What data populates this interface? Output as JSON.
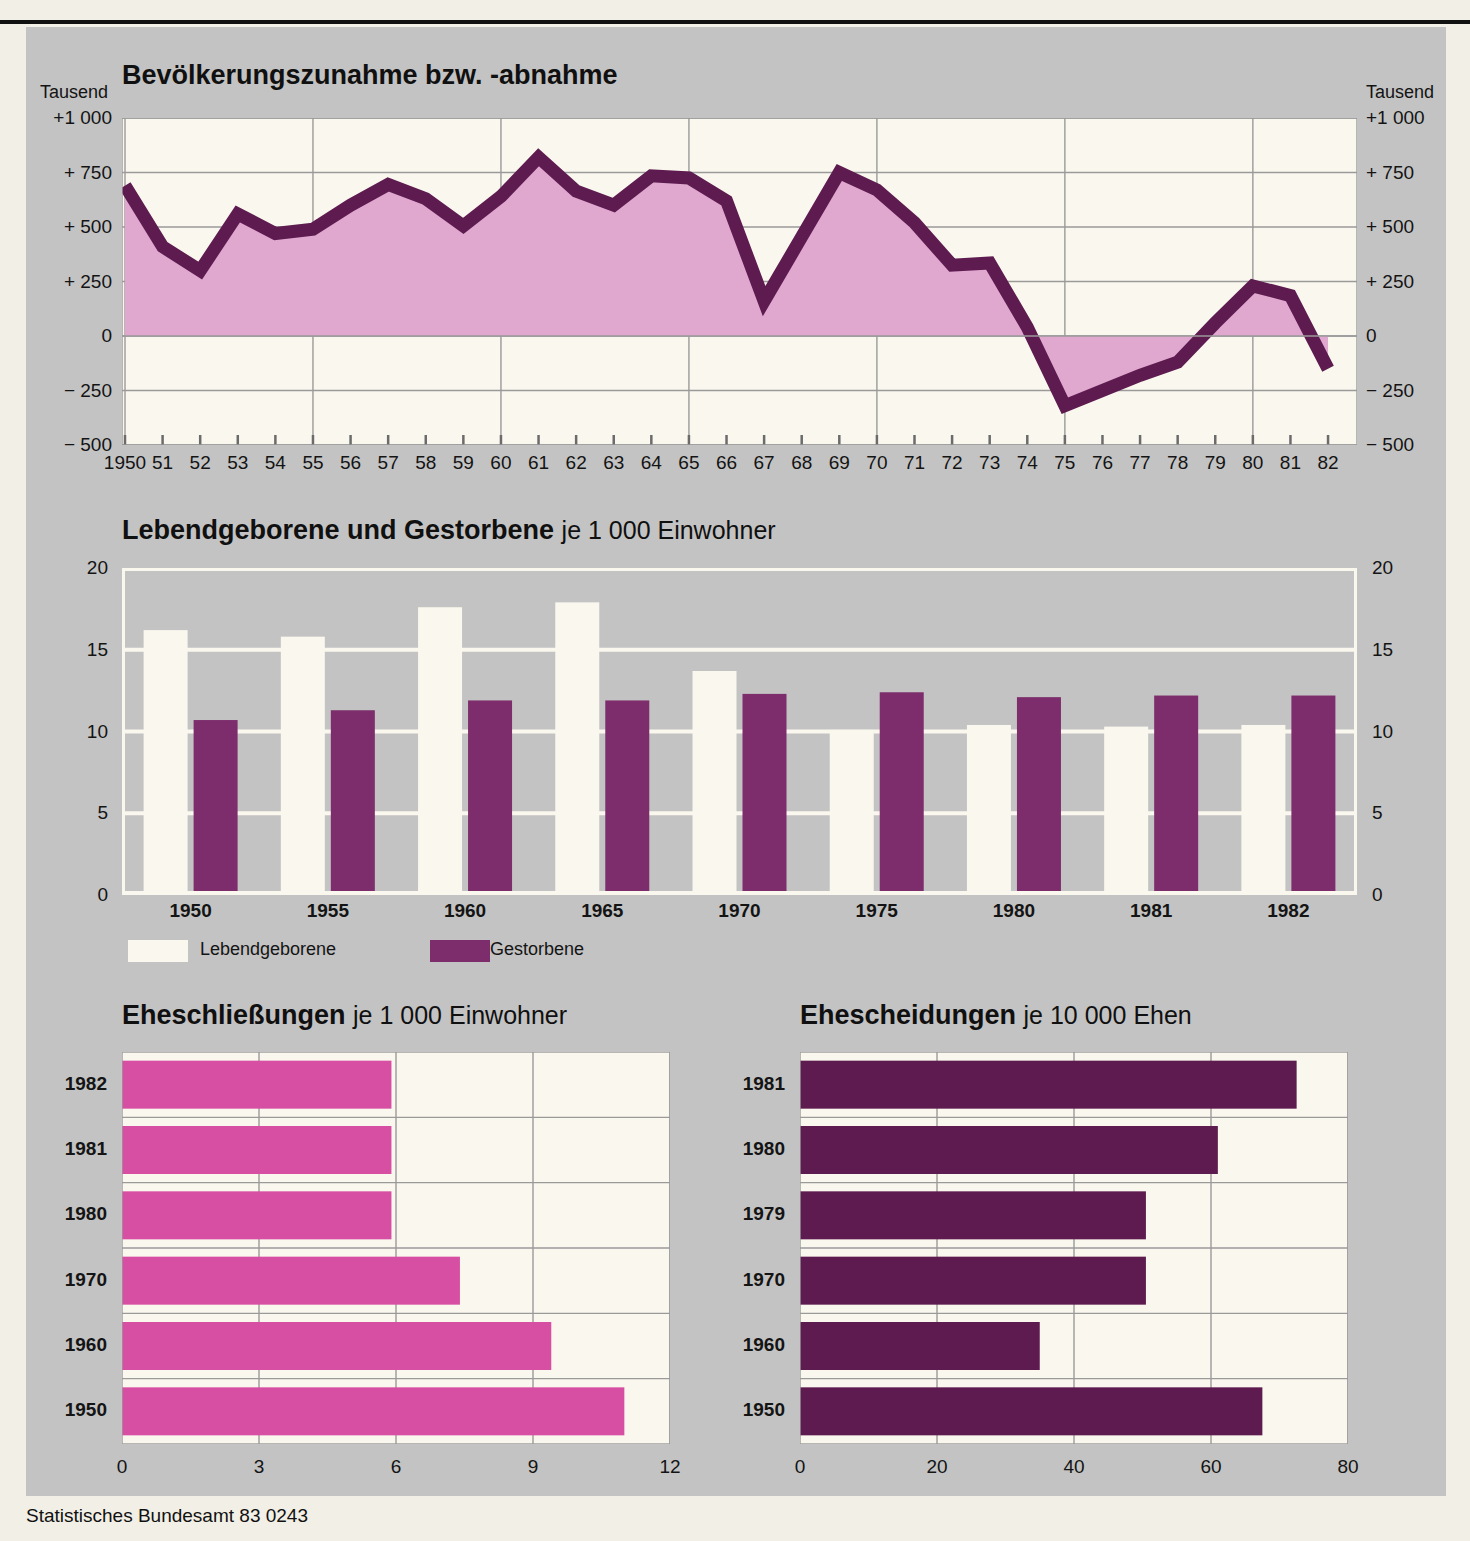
{
  "source_note": "Statistisches Bundesamt 83 0243",
  "chart_data": [
    {
      "type": "area",
      "id": "bevoelkerung",
      "title": "Bevölkerungszunahme bzw. -abnahme",
      "subtitle": "",
      "unit_label": "Tausend",
      "xlabel": "",
      "ylabel": "Tausend",
      "ylim": [
        -500,
        1000
      ],
      "yticks": [
        1000,
        750,
        500,
        250,
        0,
        -250,
        -500
      ],
      "ytick_labels": [
        "+1 000",
        "+  750",
        "+  500",
        "+  250",
        "0",
        "−  250",
        "−  500"
      ],
      "grid": true,
      "x": [
        1950,
        1951,
        1952,
        1953,
        1954,
        1955,
        1956,
        1957,
        1958,
        1959,
        1960,
        1961,
        1962,
        1963,
        1964,
        1965,
        1966,
        1967,
        1968,
        1969,
        1970,
        1971,
        1972,
        1973,
        1974,
        1975,
        1976,
        1977,
        1978,
        1979,
        1980,
        1981,
        1982
      ],
      "categories": [
        "1950",
        "51",
        "52",
        "53",
        "54",
        "55",
        "56",
        "57",
        "58",
        "59",
        "60",
        "61",
        "62",
        "63",
        "64",
        "65",
        "66",
        "67",
        "68",
        "69",
        "70",
        "71",
        "72",
        "73",
        "74",
        "75",
        "76",
        "77",
        "78",
        "79",
        "80",
        "81",
        "82"
      ],
      "values": [
        690,
        410,
        300,
        560,
        470,
        490,
        600,
        695,
        630,
        505,
        640,
        820,
        665,
        600,
        735,
        725,
        620,
        160,
        455,
        750,
        670,
        520,
        325,
        335,
        40,
        -320,
        -250,
        -180,
        -120,
        60,
        230,
        185,
        -150
      ]
    },
    {
      "type": "bar",
      "id": "geburten-sterbefaelle",
      "title": "Lebendgeborene und Gestorbene",
      "subtitle": "je 1 000 Einwohner",
      "xlabel": "",
      "ylabel": "",
      "ylim": [
        0,
        20
      ],
      "yticks": [
        0,
        5,
        10,
        15,
        20
      ],
      "grid": true,
      "legend_position": "bottom-left",
      "categories": [
        "1950",
        "1955",
        "1960",
        "1965",
        "1970",
        "1975",
        "1980",
        "1981",
        "1982"
      ],
      "series": [
        {
          "name": "Lebendgeborene",
          "color": "#faf7ee",
          "values": [
            16.2,
            15.8,
            17.6,
            17.9,
            13.7,
            10.1,
            10.4,
            10.3,
            10.4
          ]
        },
        {
          "name": "Gestorbene",
          "color": "#7d2d6b",
          "values": [
            10.7,
            11.3,
            11.9,
            11.9,
            12.3,
            12.4,
            12.1,
            12.2,
            12.2
          ]
        }
      ]
    },
    {
      "type": "bar",
      "id": "eheschliessungen",
      "orientation": "horizontal",
      "title": "Eheschließungen",
      "subtitle": "je 1 000 Einwohner",
      "xlabel": "",
      "ylabel": "",
      "xlim": [
        0,
        12
      ],
      "xticks": [
        0,
        3,
        6,
        9,
        12
      ],
      "grid": true,
      "bar_color": "#d64fa3",
      "categories": [
        "1982",
        "1981",
        "1980",
        "1970",
        "1960",
        "1950"
      ],
      "values": [
        5.9,
        5.9,
        5.9,
        7.4,
        9.4,
        11.0
      ]
    },
    {
      "type": "bar",
      "id": "ehescheidungen",
      "orientation": "horizontal",
      "title": "Ehescheidungen",
      "subtitle": "je 10 000 Ehen",
      "xlabel": "",
      "ylabel": "",
      "xlim": [
        0,
        80
      ],
      "xticks": [
        0,
        20,
        40,
        60,
        80
      ],
      "grid": true,
      "bar_color": "#5d1b50",
      "categories": [
        "1981",
        "1980",
        "1979",
        "1970",
        "1960",
        "1950"
      ],
      "values": [
        72.5,
        61.0,
        50.5,
        50.5,
        35.0,
        67.5
      ]
    }
  ],
  "colors": {
    "page_bg": "#f2efe6",
    "panel_bg": "#c3c3c3",
    "plot_bg": "#faf7ee",
    "line_dark": "#5d1b50",
    "area_fill": "#e0a7cf",
    "magenta": "#d64fa3",
    "purple": "#7d2d6b"
  }
}
